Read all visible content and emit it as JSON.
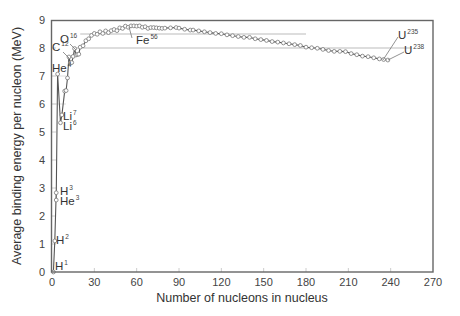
{
  "chart_data": {
    "type": "line",
    "title": "",
    "xlabel": "Number of nucleons in nucleus",
    "ylabel": "Average binding energy per nucleon (MeV)",
    "xlim": [
      0,
      270
    ],
    "ylim": [
      0,
      9
    ],
    "x_ticks": [
      0,
      30,
      60,
      90,
      120,
      150,
      180,
      210,
      240,
      270
    ],
    "y_ticks": [
      0,
      1,
      2,
      3,
      4,
      5,
      6,
      7,
      8,
      9
    ],
    "grid": false,
    "guide_lines": [
      {
        "y": 8.5,
        "x_from": 20,
        "x_to": 180
      },
      {
        "y": 8.0,
        "x_from": 15,
        "x_to": 255
      }
    ],
    "series": [
      {
        "name": "Binding energy per nucleon",
        "points": [
          [
            1,
            0.0
          ],
          [
            2,
            1.11
          ],
          [
            3,
            2.57
          ],
          [
            3,
            2.83
          ],
          [
            4,
            7.07
          ],
          [
            6,
            5.33
          ],
          [
            7,
            5.61
          ],
          [
            9,
            6.46
          ],
          [
            10,
            6.48
          ],
          [
            11,
            6.93
          ],
          [
            12,
            7.68
          ],
          [
            13,
            7.47
          ],
          [
            14,
            7.48
          ],
          [
            15,
            7.7
          ],
          [
            16,
            7.98
          ],
          [
            17,
            7.75
          ],
          [
            18,
            7.77
          ],
          [
            19,
            7.78
          ],
          [
            20,
            8.03
          ],
          [
            22,
            8.08
          ],
          [
            24,
            8.26
          ],
          [
            26,
            8.33
          ],
          [
            28,
            8.45
          ],
          [
            30,
            8.52
          ],
          [
            32,
            8.49
          ],
          [
            34,
            8.58
          ],
          [
            36,
            8.52
          ],
          [
            38,
            8.61
          ],
          [
            40,
            8.55
          ],
          [
            42,
            8.62
          ],
          [
            44,
            8.66
          ],
          [
            46,
            8.62
          ],
          [
            48,
            8.72
          ],
          [
            50,
            8.7
          ],
          [
            52,
            8.78
          ],
          [
            54,
            8.74
          ],
          [
            56,
            8.79
          ],
          [
            58,
            8.79
          ],
          [
            60,
            8.78
          ],
          [
            62,
            8.79
          ],
          [
            64,
            8.74
          ],
          [
            66,
            8.76
          ],
          [
            68,
            8.7
          ],
          [
            70,
            8.73
          ],
          [
            72,
            8.73
          ],
          [
            74,
            8.72
          ],
          [
            76,
            8.71
          ],
          [
            78,
            8.7
          ],
          [
            80,
            8.71
          ],
          [
            84,
            8.72
          ],
          [
            88,
            8.73
          ],
          [
            90,
            8.71
          ],
          [
            94,
            8.67
          ],
          [
            98,
            8.64
          ],
          [
            100,
            8.64
          ],
          [
            104,
            8.61
          ],
          [
            108,
            8.58
          ],
          [
            112,
            8.55
          ],
          [
            116,
            8.52
          ],
          [
            120,
            8.51
          ],
          [
            124,
            8.47
          ],
          [
            128,
            8.44
          ],
          [
            132,
            8.41
          ],
          [
            136,
            8.38
          ],
          [
            140,
            8.38
          ],
          [
            144,
            8.33
          ],
          [
            148,
            8.3
          ],
          [
            152,
            8.27
          ],
          [
            156,
            8.23
          ],
          [
            160,
            8.21
          ],
          [
            164,
            8.18
          ],
          [
            168,
            8.15
          ],
          [
            172,
            8.12
          ],
          [
            176,
            8.09
          ],
          [
            180,
            8.03
          ],
          [
            184,
            8.01
          ],
          [
            188,
            7.99
          ],
          [
            192,
            7.95
          ],
          [
            196,
            7.91
          ],
          [
            200,
            7.88
          ],
          [
            204,
            7.88
          ],
          [
            208,
            7.87
          ],
          [
            212,
            7.8
          ],
          [
            216,
            7.76
          ],
          [
            220,
            7.71
          ],
          [
            224,
            7.69
          ],
          [
            228,
            7.65
          ],
          [
            232,
            7.61
          ],
          [
            235,
            7.59
          ],
          [
            238,
            7.57
          ]
        ]
      }
    ],
    "annotations": [
      {
        "isotope": "H",
        "mass": "1",
        "x": 1,
        "y": 0.0
      },
      {
        "isotope": "H",
        "mass": "2",
        "x": 2,
        "y": 1.11
      },
      {
        "isotope": "H",
        "mass": "3",
        "x": 3,
        "y": 2.83
      },
      {
        "isotope": "He",
        "mass": "3",
        "x": 3,
        "y": 2.57
      },
      {
        "isotope": "He",
        "mass": "4",
        "x": 4,
        "y": 7.07
      },
      {
        "isotope": "Li",
        "mass": "7",
        "x": 7,
        "y": 5.61
      },
      {
        "isotope": "Li",
        "mass": "6",
        "x": 6,
        "y": 5.33
      },
      {
        "isotope": "C",
        "mass": "12",
        "x": 12,
        "y": 7.68
      },
      {
        "isotope": "O",
        "mass": "16",
        "x": 16,
        "y": 7.98
      },
      {
        "isotope": "Fe",
        "mass": "56",
        "x": 56,
        "y": 8.79
      },
      {
        "isotope": "U",
        "mass": "235",
        "x": 235,
        "y": 7.59
      },
      {
        "isotope": "U",
        "mass": "238",
        "x": 238,
        "y": 7.57
      }
    ],
    "colors": {
      "line": "#555555",
      "marker_stroke": "#777777",
      "frame": "#666666",
      "guide": "#bbbbbb"
    }
  }
}
